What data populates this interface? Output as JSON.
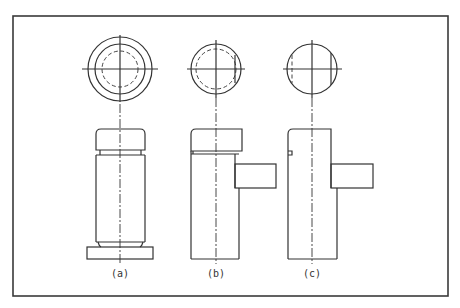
{
  "figure": {
    "type": "orthographic-views",
    "frame": {
      "x": 13,
      "y": 16,
      "width": 435,
      "height": 280
    },
    "stroke_color": "#333333",
    "views": [
      {
        "id": "a",
        "label": "(a)",
        "center_x": 120,
        "top_view": {
          "cy": 69,
          "circles": [
            {
              "r": 32,
              "style": "solid"
            },
            {
              "r": 25,
              "style": "solid"
            },
            {
              "r": 18,
              "style": "hidden"
            }
          ]
        },
        "front_view": {
          "cap": "rounded-top",
          "neck": "top-and-bottom",
          "base": "wide-flange"
        }
      },
      {
        "id": "b",
        "label": "(b)",
        "center_x": 216,
        "top_view": {
          "cy": 69,
          "circles": [
            {
              "r": 25,
              "style": "solid"
            },
            {
              "r": 21,
              "style": "hidden"
            }
          ]
        },
        "front_view": {
          "cap": "rounded-top-left",
          "groove": "single",
          "side_boss": "right"
        }
      },
      {
        "id": "c",
        "label": "(c)",
        "center_x": 312,
        "top_view": {
          "cy": 69,
          "circles": [
            {
              "r": 25,
              "style": "solid"
            }
          ],
          "flats": "both-sides"
        },
        "front_view": {
          "cap": "rounded-top-left",
          "notch": "left",
          "side_boss": "right"
        }
      }
    ]
  }
}
